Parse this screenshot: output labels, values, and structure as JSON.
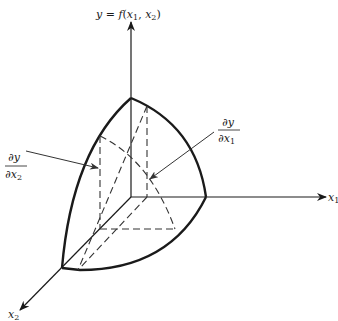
{
  "diagram": {
    "axes": {
      "y_label": {
        "lhs": "y",
        "eq": " = ",
        "fn": "f",
        "open": "(",
        "v1": "x",
        "v1_sub": "1",
        "sep": ", ",
        "v2": "x",
        "v2_sub": "2",
        "close": ")"
      },
      "x1_label": {
        "var": "x",
        "sub": "1"
      },
      "x2_label": {
        "var": "x",
        "sub": "2"
      }
    },
    "annotations": {
      "dy_dx1": {
        "num": "∂y",
        "den": "∂x",
        "den_sub": "1"
      },
      "dy_dx2": {
        "num": "∂y",
        "den": "∂x",
        "den_sub": "2"
      }
    },
    "colors": {
      "line": "#1a1a1a",
      "dashed": "#333333",
      "leader": "#444444"
    }
  }
}
